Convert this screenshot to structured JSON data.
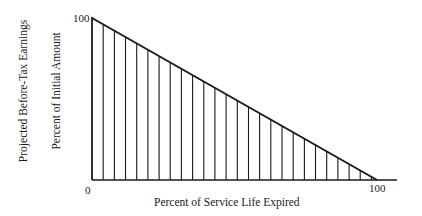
{
  "chart_data": {
    "type": "area",
    "title": "",
    "xlabel": "Percent of Service Life Expired",
    "ylabel": [
      "Projected Before-Tax Earnings",
      "Percent of Initial Amount"
    ],
    "x": [
      0,
      100
    ],
    "values": [
      100,
      0
    ],
    "xlim": [
      0,
      110
    ],
    "ylim": [
      0,
      100
    ],
    "x_ticks": [
      "0",
      "100"
    ],
    "y_ticks": [
      "100"
    ],
    "grid": false,
    "fill": "vertical hatching",
    "hatch_line_count": 25,
    "legend": null
  },
  "labels": {
    "ylabel_outer": "Projected Before-Tax Earnings",
    "ylabel_inner": "Percent of Initial Amount",
    "xlabel": "Percent of Service Life Expired",
    "y_top_tick": "100",
    "origin_tick": "0",
    "x_end_tick": "100"
  }
}
